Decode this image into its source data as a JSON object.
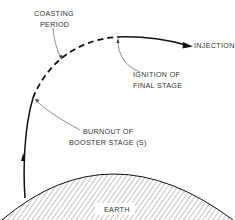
{
  "diagram": {
    "labels": {
      "coasting_line1": "COASTING",
      "coasting_line2": "PERIOD",
      "injection": "INJECTION",
      "ignition_line1": "IGNITION OF",
      "ignition_line2": "FINAL STAGE",
      "burnout_line1": "BURNOUT OF",
      "burnout_line2": "BOOSTER STAGE (S)",
      "earth": "EARTH"
    },
    "colors": {
      "line": "#111111",
      "text": "#333333",
      "hatch": "#555555",
      "background": "#ffffff"
    }
  }
}
